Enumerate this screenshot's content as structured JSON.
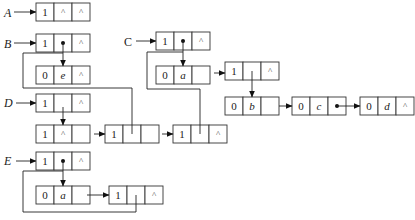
{
  "diagram": {
    "title": "",
    "type": "generalized-list-storage-structure",
    "heads": [
      {
        "label": "A",
        "italic": true
      },
      {
        "label": "B",
        "italic": true
      },
      {
        "label": "C",
        "italic": false
      },
      {
        "label": "D",
        "italic": true
      },
      {
        "label": "E",
        "italic": true
      }
    ],
    "nodes": [
      {
        "id": "A0",
        "cells": [
          "1",
          "^",
          "^"
        ]
      },
      {
        "id": "B0",
        "cells": [
          "1",
          "•",
          "^"
        ]
      },
      {
        "id": "Be",
        "cells": [
          "0",
          "e",
          "^"
        ]
      },
      {
        "id": "C0",
        "cells": [
          "1",
          "•",
          "^"
        ]
      },
      {
        "id": "Ca",
        "cells": [
          "0",
          "a",
          ""
        ]
      },
      {
        "id": "C1",
        "cells": [
          "1",
          "",
          "^"
        ]
      },
      {
        "id": "Cb",
        "cells": [
          "0",
          "b",
          ""
        ]
      },
      {
        "id": "Cc",
        "cells": [
          "0",
          "c",
          "•"
        ]
      },
      {
        "id": "Cd",
        "cells": [
          "0",
          "d",
          "^"
        ]
      },
      {
        "id": "D0",
        "cells": [
          "1",
          "",
          "^"
        ]
      },
      {
        "id": "D1",
        "cells": [
          "1",
          "^",
          ""
        ]
      },
      {
        "id": "D2",
        "cells": [
          "1",
          "",
          ""
        ]
      },
      {
        "id": "D3",
        "cells": [
          "1",
          "",
          "^"
        ]
      },
      {
        "id": "E0",
        "cells": [
          "1",
          "•",
          "^"
        ]
      },
      {
        "id": "Ea",
        "cells": [
          "0",
          "a",
          ""
        ]
      },
      {
        "id": "E1",
        "cells": [
          "1",
          "",
          "^"
        ]
      }
    ],
    "edges": [
      {
        "from": "A",
        "to": "A0"
      },
      {
        "from": "B",
        "to": "B0"
      },
      {
        "from": "B0.hp",
        "to": "Be"
      },
      {
        "from": "C",
        "to": "C0"
      },
      {
        "from": "C0.hp",
        "to": "Ca"
      },
      {
        "from": "Ca.next",
        "to": "C1"
      },
      {
        "from": "C1.hp",
        "to": "Cb"
      },
      {
        "from": "Cb.next",
        "to": "Cc"
      },
      {
        "from": "Cc.next",
        "to": "Cd"
      },
      {
        "from": "D",
        "to": "D0"
      },
      {
        "from": "D0.hp",
        "to": "D1"
      },
      {
        "from": "D1.next",
        "to": "D2"
      },
      {
        "from": "D2.next",
        "to": "D3"
      },
      {
        "from": "D2.hp",
        "to": "B0"
      },
      {
        "from": "D3.hp",
        "to": "C0"
      },
      {
        "from": "E",
        "to": "E0"
      },
      {
        "from": "E0.hp",
        "to": "Ea"
      },
      {
        "from": "Ea.next",
        "to": "E1"
      },
      {
        "from": "E1.hp",
        "to": "E0"
      }
    ]
  }
}
